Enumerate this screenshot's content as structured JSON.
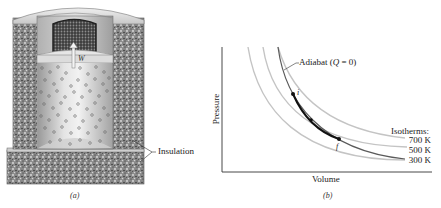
{
  "panel_a": {
    "caption": "(a)",
    "work_label": "W",
    "insulation_label": "Insulation",
    "components": [
      "insulation-wall",
      "lead-shot-load",
      "piston",
      "gas-molecules",
      "thermal-reservoir-base"
    ]
  },
  "panel_b": {
    "caption": "(b)",
    "xlabel": "Volume",
    "ylabel": "Pressure",
    "adiabat_label": "Adiabat (",
    "adiabat_q": "Q",
    "adiabat_eq": " = 0)",
    "point_i": "i",
    "point_f": "f",
    "isotherms_heading": "Isotherms:",
    "isotherms": [
      {
        "label": "700 K",
        "color": "#c8c8c8"
      },
      {
        "label": "500 K",
        "color": "#c8c8c8"
      },
      {
        "label": "300 K",
        "color": "#c8c8c8"
      }
    ],
    "colors": {
      "axis": "#333333",
      "isotherm": "#c4c4c4",
      "adiabat": "#555555",
      "process": "#111111"
    }
  }
}
